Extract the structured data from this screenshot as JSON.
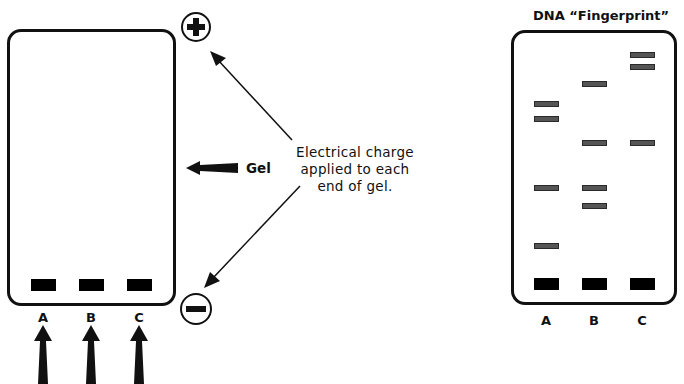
{
  "left_panel": {
    "description": "Gel electrophoresis setup",
    "gel_label": "Gel",
    "callout_lines": [
      "Electrical charge",
      "applied to each",
      "end of gel."
    ],
    "positive_terminal": "+",
    "negative_terminal": "−",
    "lanes": [
      {
        "label": "A",
        "well_x": 30
      },
      {
        "label": "B",
        "well_x": 78
      },
      {
        "label": "C",
        "well_x": 126
      }
    ]
  },
  "right_panel": {
    "title": "DNA “Fingerprint”",
    "lanes": [
      {
        "label": "A",
        "x": 534,
        "bands_y": [
          103,
          118,
          187,
          245
        ]
      },
      {
        "label": "B",
        "x": 582,
        "bands_y": [
          83,
          142,
          187,
          205
        ]
      },
      {
        "label": "C",
        "x": 630,
        "bands_y": [
          54,
          66,
          142
        ]
      }
    ],
    "well_y": 280
  },
  "colors": {
    "outline": "#111111",
    "well": "#000000",
    "band_fill": "#555555",
    "background": "#ffffff"
  }
}
